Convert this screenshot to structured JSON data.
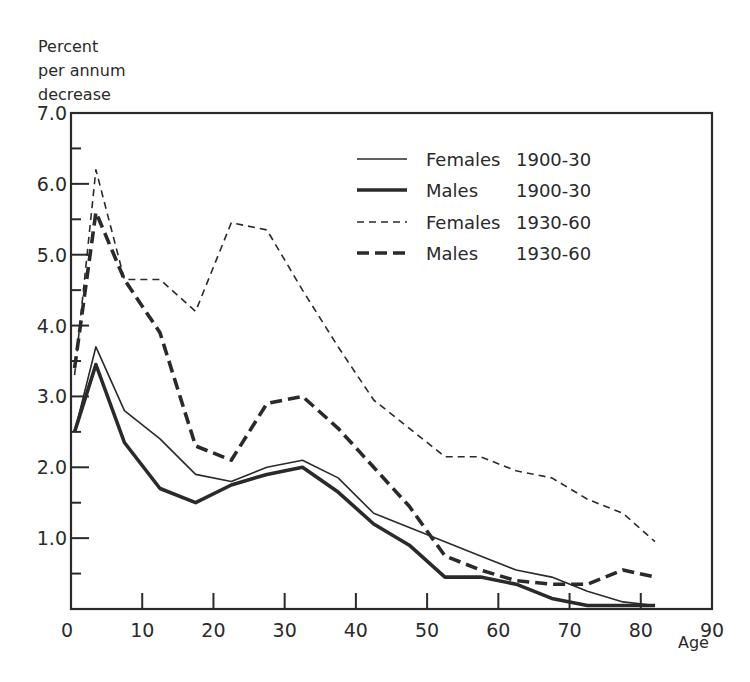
{
  "chart_data": {
    "type": "line",
    "title": "",
    "ylabel": [
      "Percent",
      "per annum",
      "decrease"
    ],
    "xlabel": "Age",
    "xlim": [
      0,
      90
    ],
    "ylim": [
      0,
      7.0
    ],
    "x_ticks": [
      0,
      10,
      20,
      30,
      40,
      50,
      60,
      70,
      80,
      90
    ],
    "y_ticks": [
      "1.0",
      "2.0",
      "3.0",
      "4.0",
      "5.0",
      "6.0",
      "7.0"
    ],
    "y_tick_values": [
      1,
      2,
      3,
      4,
      5,
      6,
      7
    ],
    "grid": false,
    "legend_position": "upper right",
    "series": [
      {
        "name": "Females 1900-30",
        "legend_label": "Females",
        "legend_period": "1900-30",
        "style": "thin-solid",
        "x": [
          0.5,
          3.5,
          7.5,
          12.5,
          17.5,
          22.5,
          27.5,
          32.5,
          37.5,
          42.5,
          47.5,
          52.5,
          57.5,
          62.5,
          67.5,
          72.5,
          77.5,
          82
        ],
        "values": [
          2.5,
          3.7,
          2.8,
          2.4,
          1.9,
          1.8,
          2.0,
          2.1,
          1.85,
          1.35,
          1.15,
          0.95,
          0.75,
          0.55,
          0.45,
          0.25,
          0.1,
          0.05
        ]
      },
      {
        "name": "Males 1900-30",
        "legend_label": "Males",
        "legend_period": "1900-30",
        "style": "thick-solid",
        "x": [
          0.5,
          3.5,
          7.5,
          12.5,
          17.5,
          22.5,
          27.5,
          32.5,
          37.5,
          42.5,
          47.5,
          52.5,
          57.5,
          62.5,
          67.5,
          72.5,
          77.5,
          82
        ],
        "values": [
          2.5,
          3.45,
          2.35,
          1.7,
          1.5,
          1.75,
          1.9,
          2.0,
          1.65,
          1.2,
          0.9,
          0.45,
          0.45,
          0.35,
          0.15,
          0.05,
          0.05,
          0.05
        ]
      },
      {
        "name": "Females 1930-60",
        "legend_label": "Females",
        "legend_period": "1930-60",
        "style": "thin-dashed",
        "x": [
          0.5,
          3.5,
          7.5,
          12.5,
          17.5,
          22.5,
          27.5,
          32.5,
          37.5,
          42.5,
          47.5,
          52.5,
          57.5,
          62.5,
          67.5,
          72.5,
          77.5,
          82
        ],
        "values": [
          3.3,
          6.2,
          4.65,
          4.65,
          4.2,
          5.45,
          5.35,
          4.5,
          3.7,
          2.95,
          2.55,
          2.15,
          2.15,
          1.95,
          1.85,
          1.55,
          1.35,
          0.95
        ]
      },
      {
        "name": "Males 1930-60",
        "legend_label": "Males",
        "legend_period": "1930-60",
        "style": "thick-dashed",
        "x": [
          0.5,
          3.5,
          7.5,
          12.5,
          17.5,
          22.5,
          27.5,
          32.5,
          37.5,
          42.5,
          47.5,
          52.5,
          57.5,
          62.5,
          67.5,
          72.5,
          77.5,
          82
        ],
        "values": [
          3.4,
          5.6,
          4.65,
          3.9,
          2.3,
          2.1,
          2.9,
          3.0,
          2.55,
          2.0,
          1.45,
          0.75,
          0.55,
          0.4,
          0.35,
          0.35,
          0.55,
          0.45
        ]
      }
    ]
  },
  "colors": {
    "ink": "#2a2a2a",
    "background": "#ffffff"
  }
}
